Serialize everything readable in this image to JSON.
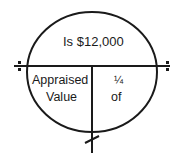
{
  "diagram": {
    "type": "formula-circle",
    "top_text": "Is $12,000",
    "bottom_left_text_line1": "Appraised",
    "bottom_left_text_line2": "Value",
    "bottom_right_text_line1": "¼",
    "bottom_right_text_line2": "of",
    "stroke_color": "#1a1a1a",
    "background": "#ffffff",
    "symbols": {
      "left_divide_marker": "divide-dots-icon",
      "right_divide_marker": "divide-dots-icon",
      "bottom_times_marker": "multiply-slash-icon"
    }
  }
}
